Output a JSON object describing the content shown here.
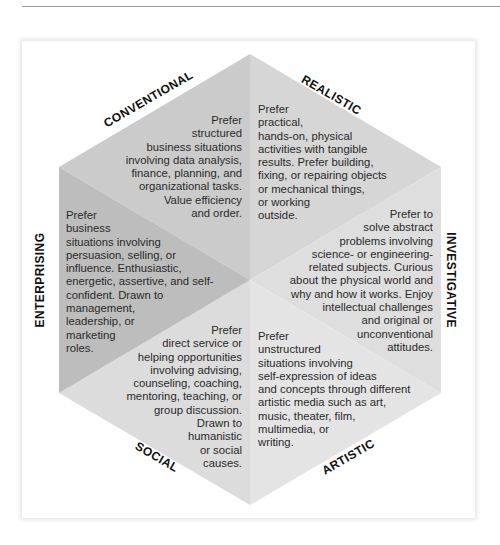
{
  "diagram": {
    "type": "hexagon",
    "colors": {
      "conventional": "#cbcbcb",
      "realistic": "#d6d6d6",
      "investigative": "#dedede",
      "artistic": "#e4e4e4",
      "social": "#dcdcdc",
      "enterprising": "#bdbdbd",
      "text": "#2a2a2a",
      "label": "#111111"
    },
    "regions": [
      {
        "label": "CONVENTIONAL",
        "description": "Prefer\nstructured\nbusiness situations\ninvolving data analysis,\nfinance, planning, and\norganizational tasks.\nValue efficiency\nand order."
      },
      {
        "label": "REALISTIC",
        "description": "Prefer\npractical,\nhands-on, physical\nactivities with tangible\nresults. Prefer building,\nfixing, or repairing objects\nor mechanical things,\nor working\noutside."
      },
      {
        "label": "INVESTIGATIVE",
        "description": "Prefer to\nsolve abstract\nproblems involving\nscience- or engineering-\nrelated subjects. Curious\nabout the physical world and\nwhy and how it works. Enjoy\nintellectual challenges\nand original or\nunconventional\nattitudes."
      },
      {
        "label": "ARTISTIC",
        "description": "Prefer\nunstructured\nsituations involving\nself-expression of ideas\nand concepts through different\nartistic media such as art,\nmusic, theater, film,\nmultimedia, or\nwriting."
      },
      {
        "label": "SOCIAL",
        "description": "Prefer\ndirect service or\nhelping opportunities\ninvolving advising,\ncounseling, coaching,\nmentoring, teaching, or\ngroup discussion.\nDrawn to\nhumanistic\nor social\ncauses."
      },
      {
        "label": "ENTERPRISING",
        "description": "Prefer\nbusiness\nsituations involving\npersuasion, selling, or\ninfluence. Enthusiastic,\nenergetic, assertive, and self-\nconfident. Drawn to\nmanagement,\nleadership, or\nmarketing\nroles."
      }
    ]
  }
}
